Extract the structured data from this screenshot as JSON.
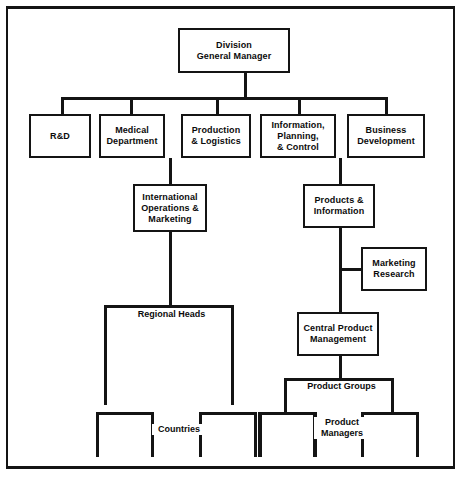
{
  "diagram": {
    "frame_color": "#141414",
    "background": "#ffffff",
    "nodes": {
      "division_general_manager": "Division\nGeneral Manager",
      "rd": "R&D",
      "medical_department": "Medical\nDepartment",
      "production_logistics": "Production\n& Logistics",
      "information_planning_control": "Information,\nPlanning,\n& Control",
      "business_development": "Business\nDevelopment",
      "international_operations_marketing": "International\nOperations &\nMarketing",
      "products_information": "Products &\nInformation",
      "marketing_research": "Marketing\nResearch",
      "central_product_management": "Central Product\nManagement"
    },
    "group_labels": {
      "regional_heads": "Regional Heads",
      "countries": "Countries",
      "product_groups": "Product Groups",
      "product_managers": "Product\nManagers"
    }
  }
}
